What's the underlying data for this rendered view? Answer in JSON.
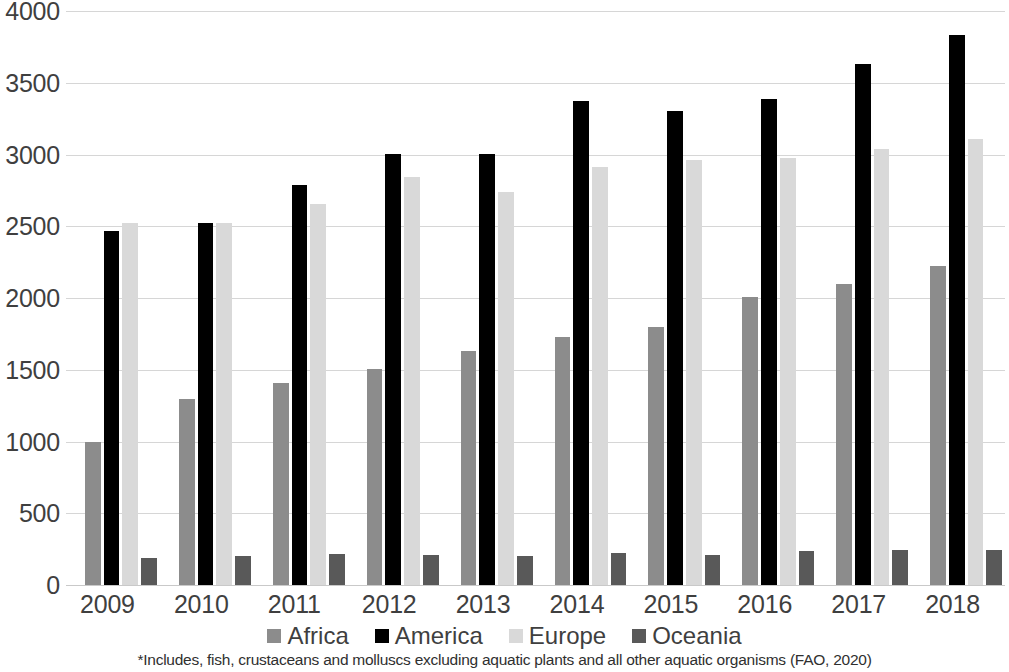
{
  "chart_data": {
    "type": "bar",
    "title": "",
    "subtitle": "",
    "xlabel": "",
    "ylabel": "",
    "categories": [
      "2009",
      "2010",
      "2011",
      "2012",
      "2013",
      "2014",
      "2015",
      "2016",
      "2017",
      "2018"
    ],
    "series": [
      {
        "name": "Africa",
        "color": "#8C8C8C",
        "values": [
          995,
          1295,
          1405,
          1505,
          1630,
          1730,
          1800,
          2010,
          2100,
          2225
        ]
      },
      {
        "name": "America",
        "color": "#000000",
        "values": [
          2465,
          2520,
          2785,
          3005,
          3005,
          3370,
          3300,
          3390,
          3630,
          3835
        ]
      },
      {
        "name": "Europe",
        "color": "#D9D9D9",
        "values": [
          2520,
          2520,
          2655,
          2840,
          2740,
          2915,
          2960,
          2975,
          3035,
          3105
        ]
      },
      {
        "name": "Oceania",
        "color": "#595959",
        "values": [
          190,
          200,
          215,
          210,
          205,
          220,
          210,
          240,
          245,
          245
        ]
      }
    ],
    "ylim": [
      0,
      4000
    ],
    "yticks": [
      0,
      500,
      1000,
      1500,
      2000,
      2500,
      3000,
      3500,
      4000
    ],
    "ytick_labels": [
      "0",
      "500",
      "1000",
      "1500",
      "2000",
      "2500",
      "3000",
      "3500",
      "4000"
    ],
    "grid": true,
    "legend_position": "bottom",
    "footnote": "*Includes, fish, crustaceans and molluscs excluding aquatic plants and all other aquatic organisms (FAO, 2020)"
  },
  "legend": {
    "items": [
      {
        "label": "Africa",
        "color": "#8C8C8C"
      },
      {
        "label": "America",
        "color": "#000000"
      },
      {
        "label": "Europe",
        "color": "#D9D9D9"
      },
      {
        "label": "Oceania",
        "color": "#595959"
      }
    ]
  }
}
